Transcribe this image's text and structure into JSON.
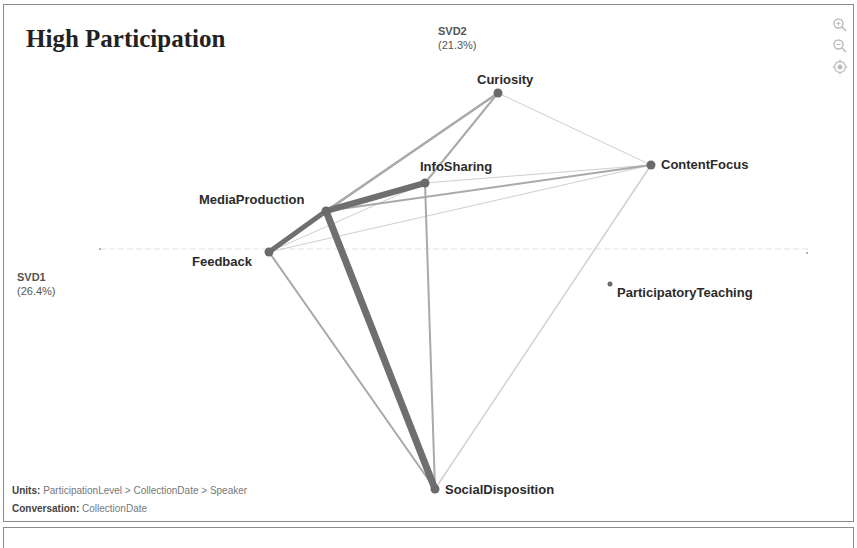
{
  "title": "High Participation",
  "axes": {
    "x": {
      "name": "SVD1",
      "pct": "(26.4%)"
    },
    "y": {
      "name": "SVD2",
      "pct": "(21.3%)"
    }
  },
  "controls": [
    "zoom-in-icon",
    "zoom-out-icon",
    "recenter-icon"
  ],
  "footer": {
    "units_label": "Units:",
    "units_value": "ParticipationLevel > CollectionDate > Speaker",
    "conversation_label": "Conversation:",
    "conversation_value": "CollectionDate"
  },
  "chart_data": {
    "type": "network",
    "title": "High Participation",
    "xlabel": "SVD1 (26.4%)",
    "ylabel": "SVD2 (21.3%)",
    "nodes": [
      {
        "id": "Curiosity",
        "x": 498,
        "y": 93
      },
      {
        "id": "ContentFocus",
        "x": 651,
        "y": 165
      },
      {
        "id": "InfoSharing",
        "x": 425,
        "y": 183
      },
      {
        "id": "MediaProduction",
        "x": 326,
        "y": 211
      },
      {
        "id": "Feedback",
        "x": 269,
        "y": 252
      },
      {
        "id": "SocialDisposition",
        "x": 435,
        "y": 489
      },
      {
        "id": "ParticipatoryTeaching",
        "x": 610,
        "y": 284
      }
    ],
    "edges": [
      {
        "source": "MediaProduction",
        "target": "SocialDisposition",
        "weight": 7
      },
      {
        "source": "MediaProduction",
        "target": "InfoSharing",
        "weight": 6
      },
      {
        "source": "Feedback",
        "target": "MediaProduction",
        "weight": 5
      },
      {
        "source": "MediaProduction",
        "target": "Curiosity",
        "weight": 2.5
      },
      {
        "source": "InfoSharing",
        "target": "Curiosity",
        "weight": 2
      },
      {
        "source": "MediaProduction",
        "target": "ContentFocus",
        "weight": 2
      },
      {
        "source": "InfoSharing",
        "target": "SocialDisposition",
        "weight": 2
      },
      {
        "source": "Feedback",
        "target": "SocialDisposition",
        "weight": 2
      },
      {
        "source": "ContentFocus",
        "target": "SocialDisposition",
        "weight": 1.5
      },
      {
        "source": "Curiosity",
        "target": "ContentFocus",
        "weight": 1
      },
      {
        "source": "InfoSharing",
        "target": "ContentFocus",
        "weight": 1
      },
      {
        "source": "Feedback",
        "target": "ContentFocus",
        "weight": 1
      },
      {
        "source": "Feedback",
        "target": "InfoSharing",
        "weight": 1
      },
      {
        "source": "Feedback",
        "target": "Curiosity",
        "weight": 1
      }
    ]
  }
}
